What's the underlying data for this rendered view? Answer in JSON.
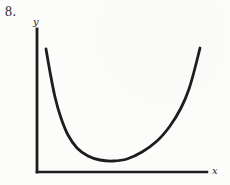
{
  "figure": {
    "problem_number": "8.",
    "y_axis_label": "y",
    "x_axis_label": "x"
  },
  "chart_data": {
    "type": "line",
    "title": "",
    "xlabel": "x",
    "ylabel": "y",
    "grid": false,
    "axis_tick_labels": [],
    "ink_color": "#1d1d1d",
    "paper_color": "#fcfcfb",
    "axes_px": {
      "origin": [
        37,
        172
      ],
      "y_axis_top": [
        37,
        29
      ],
      "x_axis_right": [
        207,
        172
      ]
    },
    "series": [
      {
        "name": "u-shaped-curve",
        "points_px": [
          [
            46,
            49
          ],
          [
            50,
            72
          ],
          [
            55,
            97
          ],
          [
            61,
            118
          ],
          [
            68,
            135
          ],
          [
            77,
            148
          ],
          [
            88,
            156
          ],
          [
            100,
            160
          ],
          [
            113,
            161
          ],
          [
            127,
            159
          ],
          [
            142,
            152
          ],
          [
            157,
            141
          ],
          [
            170,
            126
          ],
          [
            181,
            108
          ],
          [
            189,
            89
          ],
          [
            195,
            68
          ],
          [
            200,
            48
          ]
        ]
      }
    ]
  }
}
